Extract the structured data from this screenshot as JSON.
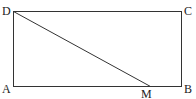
{
  "diagram": {
    "type": "geometry-figure",
    "points": [
      {
        "name": "A",
        "label": "A",
        "x": 13,
        "y": 86
      },
      {
        "name": "B",
        "label": "B",
        "x": 181,
        "y": 86
      },
      {
        "name": "C",
        "label": "C",
        "x": 181,
        "y": 11
      },
      {
        "name": "D",
        "label": "D",
        "x": 13,
        "y": 11
      },
      {
        "name": "M",
        "label": "M",
        "x": 150,
        "y": 86
      }
    ],
    "segments": [
      "AB",
      "BC",
      "CD",
      "DA",
      "DM"
    ],
    "line_color": "#333333"
  },
  "labels": {
    "A": "A",
    "B": "B",
    "C": "C",
    "D": "D",
    "M": "M"
  }
}
